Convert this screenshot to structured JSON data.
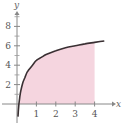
{
  "chart_data": {
    "type": "area",
    "title": "",
    "xlabel": "x",
    "ylabel": "y",
    "xlim": [
      -0.3,
      5
    ],
    "ylim": [
      -1.5,
      9.5
    ],
    "x_ticks": [
      1,
      2,
      3,
      4
    ],
    "x_tick_labels": [
      "1",
      "2",
      "3",
      "4"
    ],
    "y_ticks": [
      2,
      4,
      6,
      8
    ],
    "y_tick_labels": [
      "2",
      "4",
      "6",
      "8"
    ],
    "y_minor_ticks": [
      1,
      3,
      5,
      7,
      9
    ],
    "grid": false,
    "legend": "none",
    "shaded_region": {
      "from_x": 0.1,
      "to_x": 4,
      "description": "area under curve between curve and x-axis",
      "color": "#f5d5df"
    },
    "series": [
      {
        "name": "curve",
        "color": "#3a3033",
        "x": [
          0.05,
          0.1,
          0.15,
          0.2,
          0.3,
          0.4,
          0.5,
          0.6,
          0.8,
          1.0,
          1.25,
          1.5,
          2.0,
          2.5,
          3.0,
          3.5,
          4.0,
          4.5
        ],
        "y": [
          -1.3,
          0.0,
          0.8,
          1.4,
          2.2,
          2.7,
          3.2,
          3.5,
          4.0,
          4.5,
          4.8,
          5.1,
          5.5,
          5.8,
          6.0,
          6.2,
          6.35,
          6.5
        ]
      }
    ]
  }
}
